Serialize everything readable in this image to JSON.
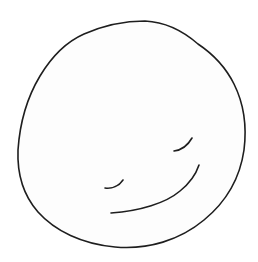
{
  "drawing": {
    "subject": "hand-drawn smiley face",
    "caption": "Hand-drawn smiley face",
    "colors": {
      "background": "#ffffff",
      "ink": "#1e1e1e",
      "face_fill": "#fdfdfd"
    },
    "elements": [
      {
        "name": "face-outline",
        "description": "irregular hand-drawn circle"
      },
      {
        "name": "left-eye",
        "description": "short curved stroke (closed eye)"
      },
      {
        "name": "right-eye",
        "description": "short curved stroke (closed eye)"
      },
      {
        "name": "mouth",
        "description": "long upward curve (smile)"
      }
    ]
  }
}
